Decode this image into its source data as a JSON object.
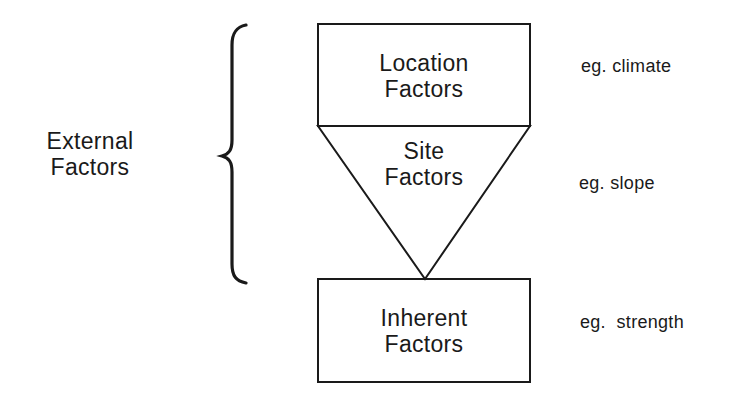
{
  "group_label": {
    "line1": "External",
    "line2": "Factors"
  },
  "boxes": [
    {
      "id": "location",
      "line1": "Location",
      "line2": "Factors",
      "shape": "rectangle"
    },
    {
      "id": "site",
      "line1": "Site",
      "line2": "Factors",
      "shape": "inverted-triangle"
    },
    {
      "id": "inherent",
      "line1": "Inherent",
      "line2": "Factors",
      "shape": "rectangle"
    }
  ],
  "examples": [
    {
      "for": "location",
      "text": "eg. climate"
    },
    {
      "for": "site",
      "text": "eg. slope"
    },
    {
      "for": "inherent",
      "text": "eg.  strength"
    }
  ],
  "colors": {
    "stroke": "#1a1a1a",
    "background": "#ffffff"
  }
}
